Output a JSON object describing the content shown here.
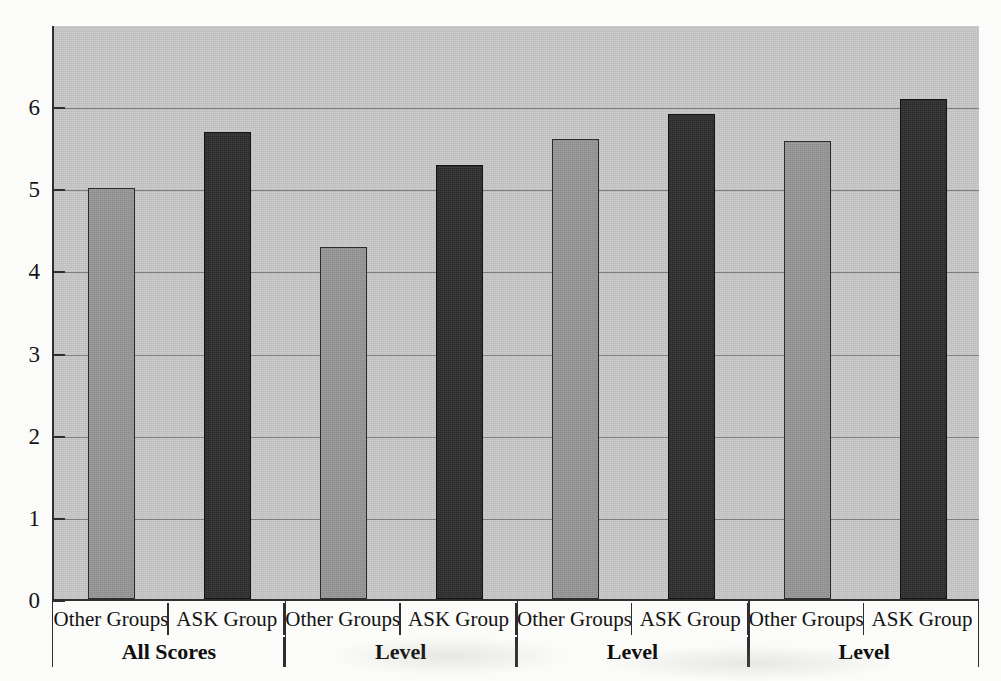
{
  "chart_data": {
    "type": "bar",
    "title": "",
    "xlabel": "",
    "ylabel": "",
    "ylim": [
      0,
      7
    ],
    "yticks": [
      0,
      1,
      2,
      3,
      4,
      5,
      6
    ],
    "ytick_labels": [
      "0",
      "1",
      "2",
      "3",
      "4",
      "5",
      "6"
    ],
    "grid": true,
    "legend": "none",
    "group_label_row": [
      "All Scores",
      "Level",
      "Level",
      "Level"
    ],
    "categories": [
      "Other Groups",
      "ASK Group",
      "Other Groups",
      "ASK Group",
      "Other Groups",
      "ASK Group",
      "Other Groups",
      "ASK Group"
    ],
    "values": [
      5.0,
      5.68,
      4.28,
      5.28,
      5.6,
      5.9,
      5.57,
      6.09
    ],
    "bar_styles": [
      "light",
      "dark",
      "light",
      "dark",
      "light",
      "dark",
      "light",
      "dark"
    ],
    "groups": [
      {
        "group_label": "All Scores",
        "bars": [
          {
            "category": "Other Groups",
            "value": 5.0,
            "style": "light"
          },
          {
            "category": "ASK Group",
            "value": 5.68,
            "style": "dark"
          }
        ]
      },
      {
        "group_label": "Level",
        "bars": [
          {
            "category": "Other Groups",
            "value": 4.28,
            "style": "light"
          },
          {
            "category": "ASK Group",
            "value": 5.28,
            "style": "dark"
          }
        ]
      },
      {
        "group_label": "Level",
        "bars": [
          {
            "category": "Other Groups",
            "value": 5.6,
            "style": "light"
          },
          {
            "category": "ASK Group",
            "value": 5.9,
            "style": "dark"
          }
        ]
      },
      {
        "group_label": "Level",
        "bars": [
          {
            "category": "Other Groups",
            "value": 5.57,
            "style": "light"
          },
          {
            "category": "ASK Group",
            "value": 6.09,
            "style": "dark"
          }
        ]
      }
    ],
    "colors": {
      "plot_background": "#c9c9c9",
      "light_bar": "#969696",
      "dark_bar": "#2c2c2c",
      "axis": "#2e2e2e",
      "gridline": "#7d7d7d",
      "page_background": "#fbfbf9",
      "text": "#131313"
    }
  },
  "axis": {
    "y_labels": [
      "6",
      "5",
      "4",
      "3",
      "2",
      "1",
      "0"
    ]
  }
}
